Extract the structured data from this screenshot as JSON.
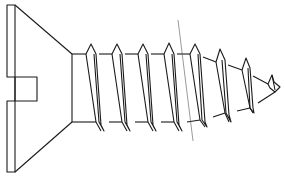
{
  "diagram": {
    "colors": {
      "line": "#1a1a1a",
      "axis_line": "#555555",
      "background": "#ffffff"
    }
  }
}
